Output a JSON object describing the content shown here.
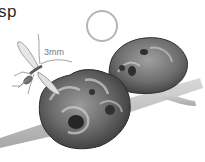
{
  "illustration": {
    "subject": "gall wasp with galls on twig",
    "title_fragment": "sp",
    "scale_label": "3mm",
    "elements": [
      "wasp",
      "size-circle",
      "large-gall",
      "small-gall",
      "twig"
    ],
    "colors": {
      "background": "#ffffff",
      "circle": "#b0b0b0",
      "gall_dark": "#3c3c3c",
      "gall_mid": "#777777",
      "gall_light": "#c8c8c8",
      "twig": "#c4c4c4",
      "wasp": "#8a8a8a"
    }
  }
}
